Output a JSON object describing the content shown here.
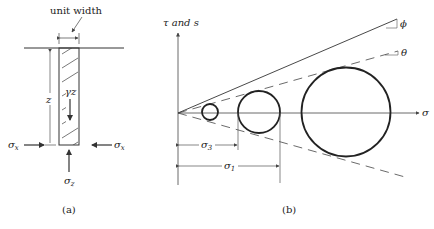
{
  "panel_a": {
    "caption": "(a)",
    "unit_width_label": "unit width",
    "depth_label": "z",
    "weight_label": "γz",
    "sigma_x_left": "σ",
    "sigma_x_left_sub": "x",
    "sigma_x_right": "σ",
    "sigma_x_right_sub": "x",
    "sigma_z": "σ",
    "sigma_z_sub": "z"
  },
  "panel_b": {
    "caption": "(b)",
    "y_axis_label": "τ and s",
    "x_axis_label": "σ",
    "phi_label": "ϕ",
    "theta_label": "θ",
    "sigma3_label": "σ",
    "sigma3_sub": "3",
    "sigma1_label": "σ",
    "sigma1_sub": "1"
  },
  "colors": {
    "line": "#333333",
    "thin": "#555555",
    "background": "#ffffff"
  }
}
